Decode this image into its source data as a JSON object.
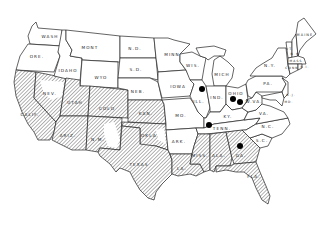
{
  "map": {
    "type": "choropleth-hatched",
    "region": "Continental United States",
    "colors": {
      "background": "#ffffff",
      "outline": "#222222",
      "hatch": "#555555",
      "dot": "#000000"
    },
    "states": [
      {
        "id": "wash",
        "label": "WASH",
        "x": 50,
        "y": 38,
        "hatched": false
      },
      {
        "id": "ore",
        "label": "ORE.",
        "x": 37,
        "y": 58,
        "hatched": false
      },
      {
        "id": "calif",
        "label": "CALIF.",
        "x": 30,
        "y": 116,
        "hatched": true
      },
      {
        "id": "idaho",
        "label": "IDAHO",
        "x": 68,
        "y": 72,
        "hatched": false
      },
      {
        "id": "nev",
        "label": "NEV.",
        "x": 50,
        "y": 95,
        "hatched": true
      },
      {
        "id": "mont",
        "label": "MONT",
        "x": 90,
        "y": 49,
        "hatched": false
      },
      {
        "id": "wyo",
        "label": "WYO",
        "x": 101,
        "y": 79,
        "hatched": false
      },
      {
        "id": "utah",
        "label": "UTAH",
        "x": 75,
        "y": 104,
        "hatched": true
      },
      {
        "id": "colo",
        "label": "COLO",
        "x": 107,
        "y": 110,
        "hatched": true
      },
      {
        "id": "ariz",
        "label": "ARIZ.",
        "x": 68,
        "y": 137,
        "hatched": true
      },
      {
        "id": "nm",
        "label": "N.M.",
        "x": 98,
        "y": 141,
        "hatched": true
      },
      {
        "id": "nd",
        "label": "N.D.",
        "x": 135,
        "y": 50,
        "hatched": false
      },
      {
        "id": "sd",
        "label": "S.D.",
        "x": 136,
        "y": 71,
        "hatched": false
      },
      {
        "id": "neb",
        "label": "NEB.",
        "x": 138,
        "y": 93,
        "hatched": false
      },
      {
        "id": "kan",
        "label": "KAN.",
        "x": 146,
        "y": 115,
        "hatched": true
      },
      {
        "id": "okla",
        "label": "OKLA.",
        "x": 150,
        "y": 137,
        "hatched": true
      },
      {
        "id": "texas",
        "label": "TEXAS",
        "x": 139,
        "y": 166,
        "hatched": true
      },
      {
        "id": "minn",
        "label": "MINN",
        "x": 172,
        "y": 56,
        "hatched": false
      },
      {
        "id": "iowa",
        "label": "IOWA",
        "x": 178,
        "y": 88,
        "hatched": false
      },
      {
        "id": "mo",
        "label": "MO.",
        "x": 181,
        "y": 117,
        "hatched": false
      },
      {
        "id": "ark",
        "label": "ARK.",
        "x": 179,
        "y": 143,
        "hatched": false
      },
      {
        "id": "la",
        "label": "LA.",
        "x": 182,
        "y": 176,
        "hatched": true
      },
      {
        "id": "wis",
        "label": "WIS.",
        "x": 189,
        "y": 66,
        "hatched": false
      },
      {
        "id": "ill",
        "label": "ILL.",
        "x": 200,
        "y": 102,
        "hatched": false
      },
      {
        "id": "mich",
        "label": "MICH",
        "x": 221,
        "y": 75,
        "hatched": false
      },
      {
        "id": "ind",
        "label": "IND.",
        "x": 219,
        "y": 97,
        "hatched": false
      },
      {
        "id": "ohio",
        "label": "OHIO",
        "x": 236,
        "y": 95,
        "hatched": false
      },
      {
        "id": "ky",
        "label": "KY.",
        "x": 228,
        "y": 116,
        "hatched": false
      },
      {
        "id": "tenn",
        "label": "TENN.",
        "x": 222,
        "y": 133,
        "hatched": false
      },
      {
        "id": "miss",
        "label": "MISS.",
        "x": 198,
        "y": 158,
        "hatched": true
      },
      {
        "id": "ala",
        "label": "ALA.",
        "x": 218,
        "y": 157,
        "hatched": true
      },
      {
        "id": "ga",
        "label": "GA.",
        "x": 241,
        "y": 157,
        "hatched": true
      },
      {
        "id": "fla",
        "label": "FLA.",
        "x": 254,
        "y": 179,
        "hatched": true
      },
      {
        "id": "sc",
        "label": "S.C.",
        "x": 262,
        "y": 142,
        "hatched": false
      },
      {
        "id": "nc",
        "label": "N.C.",
        "x": 268,
        "y": 127,
        "hatched": false
      },
      {
        "id": "va",
        "label": "VA.",
        "x": 262,
        "y": 113,
        "hatched": false
      },
      {
        "id": "wva",
        "label": "W.VA.",
        "x": 251,
        "y": 103,
        "hatched": false
      },
      {
        "id": "pa",
        "label": "PA.",
        "x": 268,
        "y": 84,
        "hatched": false
      },
      {
        "id": "ny",
        "label": "N.Y.",
        "x": 270,
        "y": 66,
        "hatched": false
      },
      {
        "id": "vt",
        "label": "VT.",
        "x": 290,
        "y": 49,
        "hatched": false
      },
      {
        "id": "nh",
        "label": "N.H.",
        "x": 296,
        "y": 55,
        "hatched": false
      },
      {
        "id": "maine",
        "label": "MAINE",
        "x": 303,
        "y": 37,
        "hatched": false
      },
      {
        "id": "mass",
        "label": "MASS.",
        "x": 296,
        "y": 62,
        "hatched": false
      },
      {
        "id": "ri",
        "label": "R.I.",
        "x": 303,
        "y": 67,
        "hatched": false
      },
      {
        "id": "conn",
        "label": "CONN.",
        "x": 293,
        "y": 69,
        "hatched": false
      },
      {
        "id": "nj",
        "label": "N.J.",
        "x": 286,
        "y": 96,
        "hatched": false
      },
      {
        "id": "md",
        "label": "MD.",
        "x": 281,
        "y": 102,
        "hatched": false
      }
    ],
    "points": [
      {
        "id": "dot-ill",
        "state": "ILL.",
        "x": 202,
        "y": 89
      },
      {
        "id": "dot-ohio-1",
        "state": "OHIO",
        "x": 233,
        "y": 99
      },
      {
        "id": "dot-ohio-2",
        "state": "OHIO",
        "x": 240,
        "y": 102
      },
      {
        "id": "dot-ky",
        "state": "KY.",
        "x": 209,
        "y": 125
      },
      {
        "id": "dot-ga",
        "state": "GA.",
        "x": 240,
        "y": 146
      }
    ]
  }
}
